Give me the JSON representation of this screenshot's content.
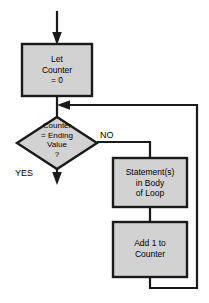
{
  "diagram": {
    "colors": {
      "node_fill": "#d2d2d2",
      "node_stroke": "#1a1a1a",
      "connector": "#1a1a1a",
      "background": "#ffffff",
      "text": "#000000"
    },
    "nodes": [
      {
        "id": "init",
        "shape": "process",
        "label": "Let\nCounter\n= 0",
        "x": 22,
        "y": 44,
        "w": 70,
        "h": 52
      },
      {
        "id": "test",
        "shape": "decision",
        "label": "Counter\n= Ending\nValue\n?",
        "x": 17,
        "y": 117,
        "w": 80,
        "h": 52
      },
      {
        "id": "body",
        "shape": "process",
        "label": "Statement(s)\nin Body\nof Loop",
        "x": 113,
        "y": 158,
        "w": 74,
        "h": 49
      },
      {
        "id": "increment",
        "shape": "process",
        "label": "Add 1 to\nCounter",
        "x": 113,
        "y": 222,
        "w": 74,
        "h": 55
      }
    ],
    "edges": [
      {
        "id": "entry",
        "from": "start",
        "to": "init",
        "label": "",
        "arrow": "down"
      },
      {
        "id": "init-to-test",
        "from": "init",
        "to": "test",
        "label": "",
        "arrow": "none"
      },
      {
        "id": "test-no",
        "from": "test",
        "to": "body",
        "label": "NO",
        "arrow": "none"
      },
      {
        "id": "test-yes",
        "from": "test",
        "to": "exit",
        "label": "YES",
        "arrow": "down"
      },
      {
        "id": "body-to-increment",
        "from": "body",
        "to": "increment",
        "label": "",
        "arrow": "none"
      },
      {
        "id": "loop-back",
        "from": "increment",
        "to": "test",
        "label": "",
        "arrow": "left"
      }
    ],
    "edge_labels": {
      "no": "NO",
      "yes": "YES"
    }
  }
}
